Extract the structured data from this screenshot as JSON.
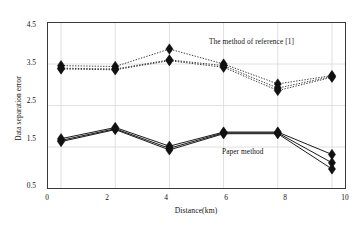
{
  "chart_data": {
    "type": "line",
    "title": "",
    "xlabel": "Distance(km)",
    "ylabel": "Data separation error",
    "x": [
      0,
      2,
      4,
      6,
      8,
      10
    ],
    "xlim": [
      -0.5,
      10.5
    ],
    "ylim": [
      0.5,
      4.5
    ],
    "xticks": [
      "0",
      "2",
      "4",
      "6",
      "8",
      "10"
    ],
    "yticks": [
      "0.5",
      "1.5",
      "2.5",
      "3.5",
      "4.5"
    ],
    "grid": true,
    "legend_position": "inline-annotation",
    "annotations": [
      {
        "text": "The method of reference [1]",
        "x": 6.0,
        "y": 3.95
      },
      {
        "text": "Paper method",
        "x": 6.4,
        "y": 1.55
      }
    ],
    "series": [
      {
        "name": "The method of reference [1] - upper",
        "group": "reference",
        "style": "dotted",
        "marker": "diamond",
        "values": [
          3.46,
          3.44,
          3.86,
          3.5,
          3.02,
          3.22
        ]
      },
      {
        "name": "The method of reference [1] - middle",
        "group": "reference",
        "style": "dotted",
        "marker": "diamond",
        "values": [
          3.4,
          3.38,
          3.6,
          3.46,
          2.92,
          3.2
        ]
      },
      {
        "name": "The method of reference [1] - lower",
        "group": "reference",
        "style": "dotted",
        "marker": "diamond",
        "values": [
          3.38,
          3.36,
          3.58,
          3.42,
          2.86,
          3.18
        ]
      },
      {
        "name": "Paper method - upper",
        "group": "paper",
        "style": "solid",
        "marker": "diamond",
        "values": [
          1.7,
          1.97,
          1.52,
          1.86,
          1.86,
          1.32
        ]
      },
      {
        "name": "Paper method - middle",
        "group": "paper",
        "style": "solid",
        "marker": "diamond",
        "values": [
          1.66,
          1.94,
          1.47,
          1.84,
          1.84,
          1.12
        ]
      },
      {
        "name": "Paper method - lower",
        "group": "paper",
        "style": "solid",
        "marker": "diamond",
        "values": [
          1.63,
          1.92,
          1.43,
          1.82,
          1.82,
          0.97
        ]
      }
    ],
    "colors": {
      "axis": "#3a3a3a",
      "grid": "#d8d8d8",
      "series": "#000000",
      "marker": "#111111",
      "background": "#ffffff"
    }
  }
}
